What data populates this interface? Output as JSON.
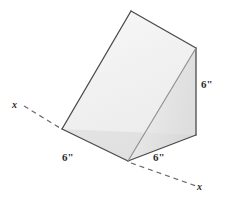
{
  "figure": {
    "type": "geometric-solid-diagram",
    "solid": "triangular prism (wedge)",
    "background_color": "#ffffff",
    "edge_color": "#4a4a4a",
    "dashed_line_color": "#6b6b6b"
  },
  "labels": {
    "dimension_bottom_left": "6\"",
    "dimension_bottom_right": "6\"",
    "dimension_right": "6\"",
    "axis_left": "x",
    "axis_right": "x"
  },
  "faces": {
    "slant_top": {
      "name": "slanted-top-face",
      "fill": "#f1f1f1",
      "points": "131,11 196,48 128,161 62,129"
    },
    "right_end": {
      "name": "right-end-face",
      "fill": "#e6e6e6",
      "points": "196,48 196,135 128,161"
    },
    "front_lower": {
      "name": "front-lower-face",
      "fill": "#dedede",
      "points": "62,129 128,161 196,135"
    }
  },
  "geometry": {
    "vertices": {
      "apex_top": [
        131,
        11
      ],
      "top_right": [
        196,
        48
      ],
      "bottom_right": [
        196,
        135
      ],
      "bottom_center": [
        128,
        161
      ],
      "left": [
        62,
        129
      ]
    },
    "axis_dash_left": {
      "from": [
        24,
        106
      ],
      "to": [
        60,
        128
      ]
    },
    "axis_dash_right": {
      "from": [
        131,
        163
      ],
      "to": [
        196,
        186
      ]
    }
  }
}
